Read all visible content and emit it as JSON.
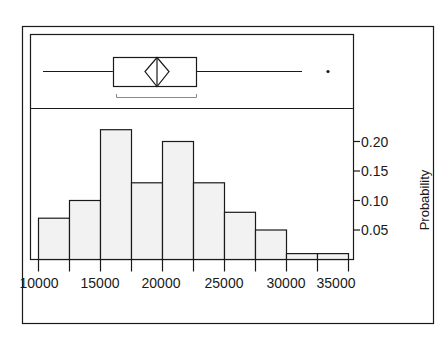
{
  "chart_data": {
    "type": "bar",
    "subtype": "histogram_with_boxplot",
    "title": "",
    "xlabel": "",
    "ylabel": "Probability",
    "y_axis_position": "right",
    "xlim": [
      10000,
      35000
    ],
    "ylim": [
      0,
      0.22
    ],
    "grid": false,
    "legend": null,
    "bin_width": 2500,
    "bins": [
      {
        "from": 10000,
        "to": 12500,
        "value": 0.07
      },
      {
        "from": 12500,
        "to": 15000,
        "value": 0.1
      },
      {
        "from": 15000,
        "to": 17500,
        "value": 0.22
      },
      {
        "from": 17500,
        "to": 20000,
        "value": 0.13
      },
      {
        "from": 20000,
        "to": 22500,
        "value": 0.2
      },
      {
        "from": 22500,
        "to": 25000,
        "value": 0.13
      },
      {
        "from": 25000,
        "to": 27500,
        "value": 0.08
      },
      {
        "from": 27500,
        "to": 30000,
        "value": 0.05
      },
      {
        "from": 30000,
        "to": 32500,
        "value": 0.01
      },
      {
        "from": 32500,
        "to": 35000,
        "value": 0.01
      }
    ],
    "categories": [
      "10000-12500",
      "12500-15000",
      "15000-17500",
      "17500-20000",
      "20000-22500",
      "22500-25000",
      "25000-27500",
      "27500-30000",
      "30000-32500",
      "32500-35000"
    ],
    "values": [
      0.07,
      0.1,
      0.22,
      0.13,
      0.2,
      0.13,
      0.08,
      0.05,
      0.01,
      0.01
    ],
    "x_tick_labels": [
      "10000",
      "15000",
      "20000",
      "25000",
      "30000",
      "35000"
    ],
    "y_tick_labels": [
      "0.05",
      "0.10",
      "0.15",
      "0.20"
    ],
    "boxplot": {
      "whisker_low": 10400,
      "q1": 16000,
      "median": 19500,
      "mean": 19500,
      "q3": 22700,
      "whisker_high": 31700,
      "outliers": [
        33800
      ],
      "shortest_half_bracket": [
        16200,
        22700
      ]
    }
  },
  "axis": {
    "y_title": "Probability",
    "x_ticks": [
      {
        "value": 10000,
        "label": "10000"
      },
      {
        "value": 15000,
        "label": "15000"
      },
      {
        "value": 20000,
        "label": "20000"
      },
      {
        "value": 25000,
        "label": "25000"
      },
      {
        "value": 30000,
        "label": "30000"
      },
      {
        "value": 35000,
        "label": "35000"
      }
    ],
    "y_ticks": [
      {
        "value": 0.05,
        "label": "0.05"
      },
      {
        "value": 0.1,
        "label": "0.10"
      },
      {
        "value": 0.15,
        "label": "0.15"
      },
      {
        "value": 0.2,
        "label": "0.20"
      }
    ]
  },
  "colors": {
    "bar_fill": "#f2f2f2",
    "stroke": "#1a1a1a",
    "bracket": "#8a8a8a",
    "background": "#ffffff"
  }
}
